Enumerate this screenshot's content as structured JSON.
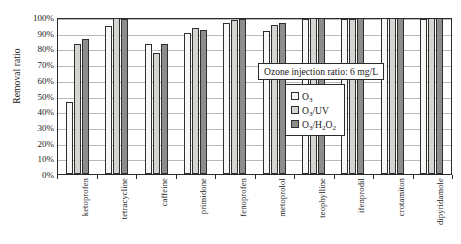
{
  "chart_data": {
    "type": "bar",
    "title": "",
    "xlabel": "",
    "ylabel": "Removal ratio",
    "ylim": [
      0,
      100
    ],
    "ytick_labels": [
      "0%",
      "10%",
      "20%",
      "30%",
      "40%",
      "50%",
      "60%",
      "70%",
      "80%",
      "90%",
      "100%"
    ],
    "ytick_values": [
      0,
      10,
      20,
      30,
      40,
      50,
      60,
      70,
      80,
      90,
      100
    ],
    "grid": true,
    "legend_position": "inside-right",
    "annotation": "Ozone injection ratio: 6 mg/L",
    "categories": [
      "ketoprofen",
      "tetracycline",
      "caffeine",
      "primidone",
      "fenoprofen",
      "metoprolol",
      "teophylline",
      "ifenprodil",
      "crotamiton",
      "dipyridamole"
    ],
    "series": [
      {
        "name": "O3",
        "label_html": "O<sub>3</sub>",
        "color": "#f7f7f5",
        "values": [
          46,
          94,
          83,
          90,
          96,
          91,
          99,
          99,
          100,
          99
        ]
      },
      {
        "name": "O3/UV",
        "label_html": "O<sub>3</sub>/UV",
        "color": "#d4d4d0",
        "values": [
          83,
          100,
          77,
          93,
          98,
          95,
          100,
          99,
          100,
          100
        ]
      },
      {
        "name": "O3/H2O2",
        "label_html": "O<sub>3</sub>/H<sub>2</sub>O<sub>2</sub>",
        "color": "#8d8d8b",
        "values": [
          86,
          99,
          83,
          92,
          99,
          96,
          100,
          100,
          100,
          100
        ]
      }
    ]
  }
}
